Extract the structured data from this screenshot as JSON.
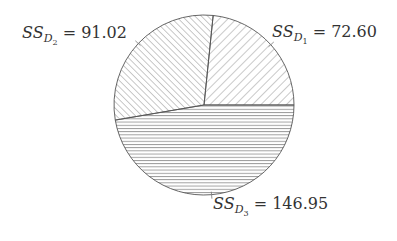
{
  "chart_data": {
    "type": "pie",
    "title": "",
    "categories": [
      "SS_D1",
      "SS_D2",
      "SS_D3"
    ],
    "values": [
      72.6,
      91.02,
      146.95
    ],
    "labels": [
      {
        "prefix": "SS",
        "sub": "D",
        "subsub": "1",
        "eq": " = 72.60",
        "value": "72.60"
      },
      {
        "prefix": "SS",
        "sub": "D",
        "subsub": "2",
        "eq": " = 91.02",
        "value": "91.02"
      },
      {
        "prefix": "SS",
        "sub": "D",
        "subsub": "3",
        "eq": " = 146.95",
        "value": "146.95"
      }
    ],
    "start_angle_deg": 0,
    "direction": "counterclockwise",
    "hatches": [
      "forward-diagonal",
      "back-diagonal",
      "horizontal"
    ],
    "edge_color": "#555555",
    "hatch_color": "#777777",
    "legend": "none"
  }
}
